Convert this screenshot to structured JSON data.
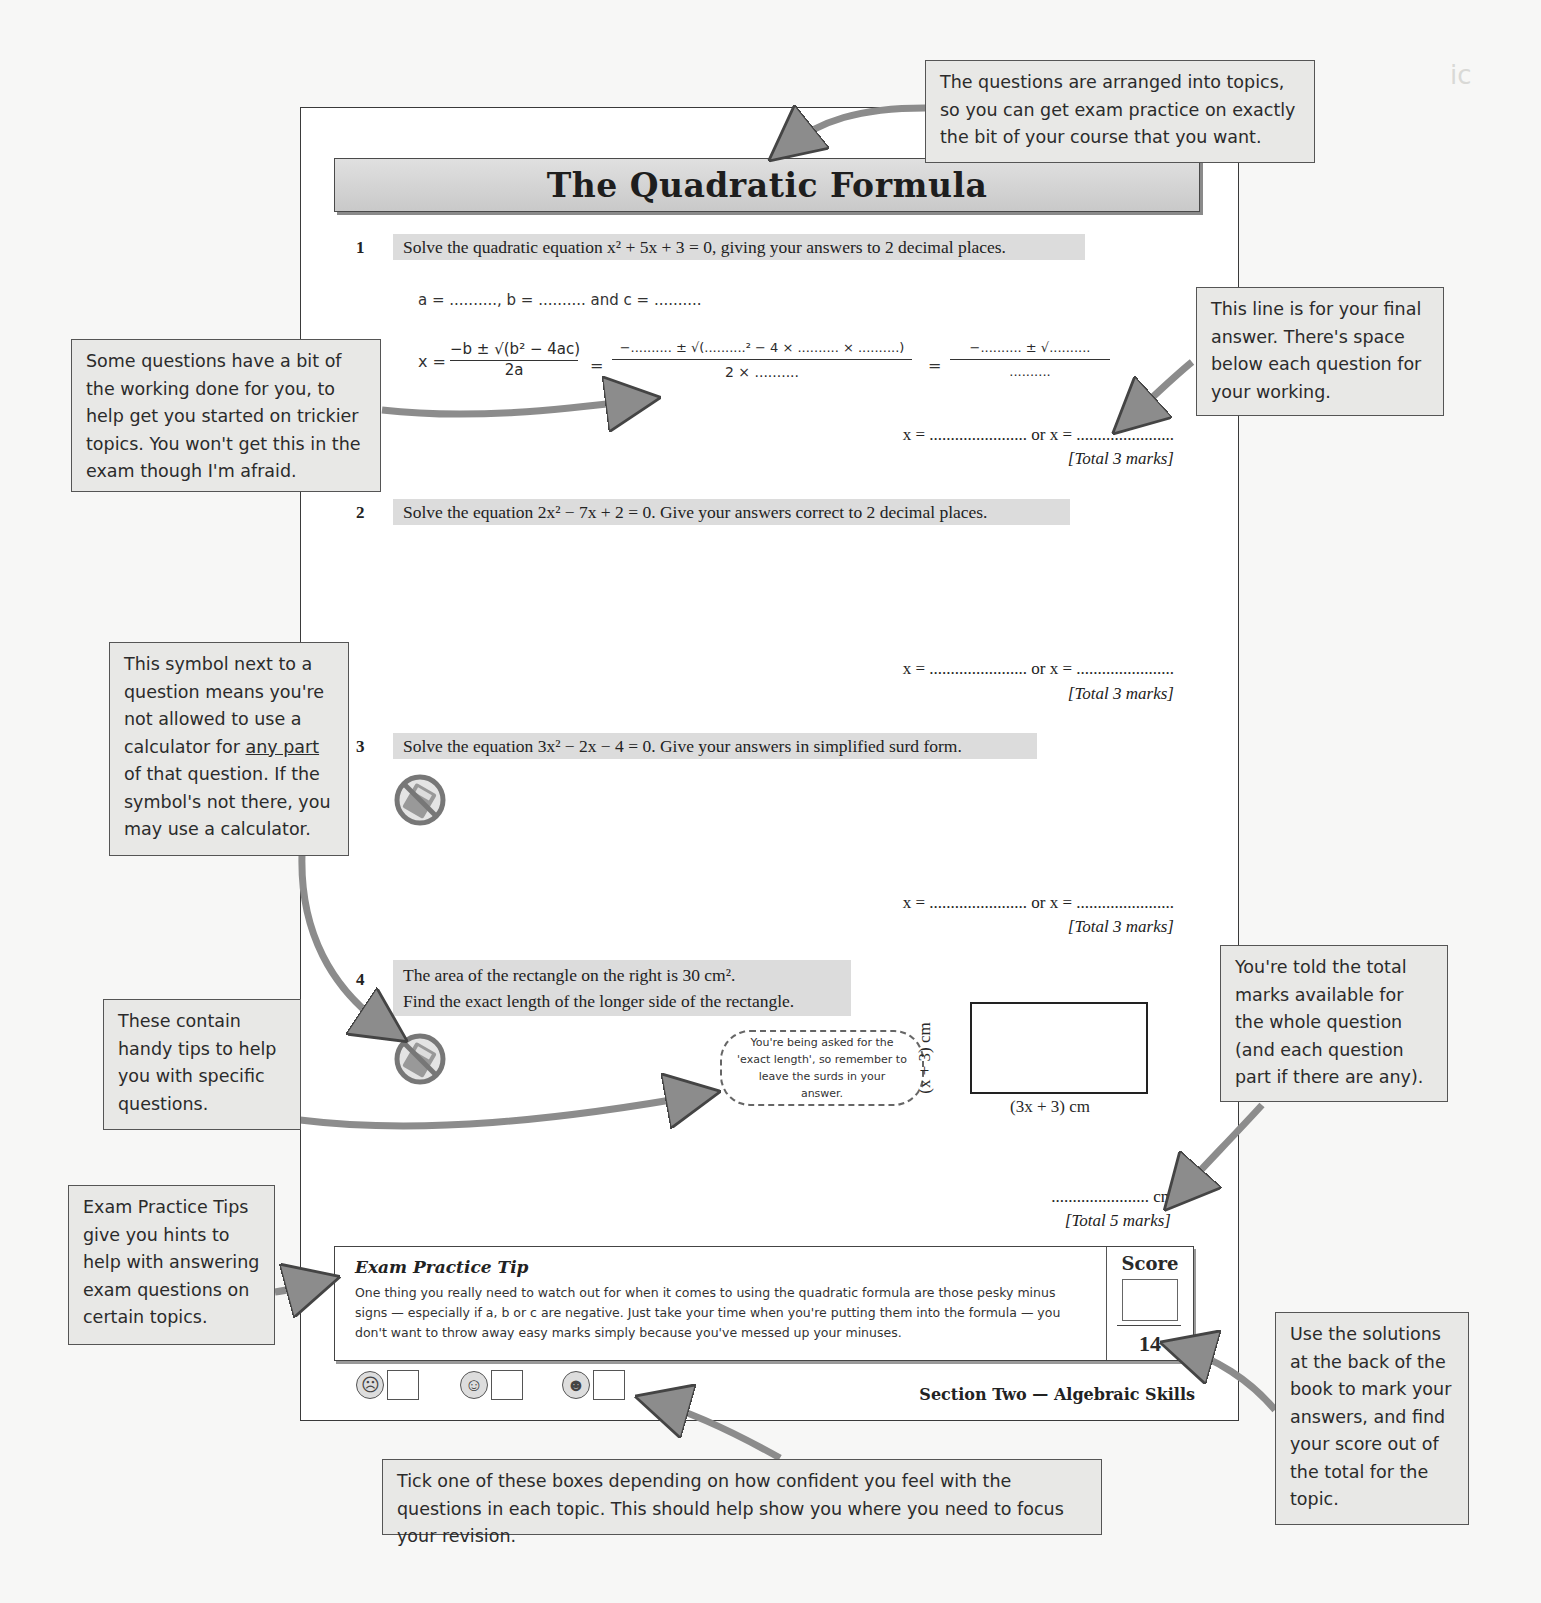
{
  "page": {
    "title": "The Quadratic Formula",
    "footer": "Section Two — Algebraic Skills",
    "colors": {
      "title_bar": "#d4d4d4",
      "question_bar": "#dcdcdc",
      "callout_bg": "#e8e8e6",
      "arrow": "#8c8c8c"
    }
  },
  "questions": [
    {
      "number": "1",
      "text": "Solve the quadratic equation x² + 5x + 3 = 0, giving your answers to 2 decimal places.",
      "working": {
        "coefficients": "a = ..........,  b = ..........  and  c = ..........",
        "formula_lhs": "x =",
        "formula_num": "−b ± √(b² − 4ac)",
        "formula_den": "2a",
        "step1_num": "−.......... ± √(..........² − 4 × .......... × ..........)",
        "step1_den": "2 × ..........",
        "step2_num": "−.......... ± √..........",
        "step2_den": ".........."
      },
      "answer_line": "x = ....................... or x = .......................",
      "marks": "[Total 3 marks]",
      "no_calculator": false
    },
    {
      "number": "2",
      "text": "Solve the equation 2x² − 7x + 2 = 0.  Give your answers correct to 2 decimal places.",
      "answer_line": "x = ....................... or x = .......................",
      "marks": "[Total 3 marks]",
      "no_calculator": false
    },
    {
      "number": "3",
      "text": "Solve the equation 3x² − 2x − 4 = 0.  Give your answers in simplified surd form.",
      "answer_line": "x = ....................... or x = .......................",
      "marks": "[Total 3 marks]",
      "no_calculator": true
    },
    {
      "number": "4",
      "text_line1": "The area of the rectangle on the right is 30 cm².",
      "text_line2": "Find the exact length of the longer side of the rectangle.",
      "hint": "You're being asked for the 'exact length', so remember to leave the surds in your answer.",
      "rect_side_label": "(x + 3) cm",
      "rect_bottom_label": "(3x + 3) cm",
      "answer_line": "....................... cm",
      "marks": "[Total 5 marks]",
      "no_calculator": true
    }
  ],
  "exam_tip": {
    "title": "Exam Practice Tip",
    "body": "One thing you really need to watch out for when it comes to using the quadratic formula are those pesky minus signs — especially if a, b or c are negative.  Just take your time when you're putting them into the formula — you don't want to throw away easy marks simply because you've messed up your minuses."
  },
  "score": {
    "label": "Score",
    "total": "14"
  },
  "confidence": [
    {
      "face": "sad-face-icon",
      "glyph": "☹"
    },
    {
      "face": "neutral-face-icon",
      "glyph": "☺"
    },
    {
      "face": "happy-face-icon",
      "glyph": "☻"
    }
  ],
  "callouts": {
    "topics": "The questions are arranged into topics, so you can get exam practice on exactly the bit of your course that you want.",
    "working": "Some questions have a bit of the working done for you, to help get you started on trickier topics.  You won't get this in the exam though I'm afraid.",
    "final_answer": "This line is for your final answer.  There's space below each question for your working.",
    "calculator_pre": "This symbol next to a question means you're not allowed to use a calculator for ",
    "calculator_underline": "any part",
    "calculator_post": " of that question.  If the symbol's not there, you may use a calculator.",
    "tips": "These contain handy tips to help you with specific questions.",
    "total_marks": "You're told the total marks available for the whole question (and each question part if there are any).",
    "exam_tips": "Exam Practice Tips give you hints to help with answering exam questions on certain topics.",
    "solutions": "Use the solutions at the back of the book to mark your answers, and find your score out of the total for the topic.",
    "tick_boxes": "Tick one of these boxes depending on how confident you feel with the questions in each topic.  This should help show you where you need to focus your revision."
  }
}
